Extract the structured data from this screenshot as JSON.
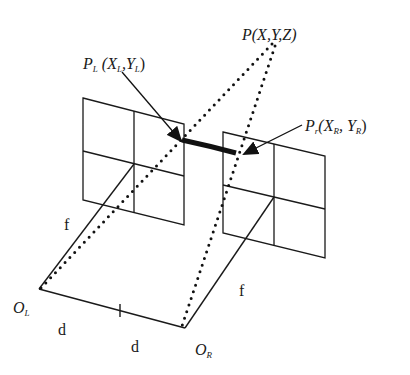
{
  "diagram": {
    "type": "stereo-vision-geometry",
    "stroke_color": "#1a1a1a",
    "background": "#ffffff",
    "labels": {
      "world_point": {
        "main": "P",
        "coords": "(X,Y,Z)"
      },
      "left_projection": {
        "main": "P",
        "sub": "L",
        "open": "(X",
        "sub_x": "L",
        "mid": ",Y",
        "sub_y": "L",
        "close": ")"
      },
      "right_projection": {
        "main": "P",
        "sub": "r",
        "open": "(X",
        "sub_x": "R",
        "mid": ", Y",
        "sub_y": "R",
        "close": ")"
      },
      "left_focal": "f",
      "right_focal": "f",
      "left_origin": {
        "main": "O",
        "sub": "L"
      },
      "right_origin": {
        "main": "O",
        "sub": "R"
      },
      "baseline_left_half": "d",
      "baseline_right_half": "d"
    },
    "points": {
      "P": [
        273,
        43
      ],
      "O_L": [
        39,
        289
      ],
      "O_R": [
        185,
        328
      ],
      "left_plane_center": [
        134,
        164
      ],
      "right_plane_center": [
        274,
        197
      ],
      "baseline_midpoint": [
        120,
        310
      ]
    },
    "planes": [
      {
        "name": "left-image-plane",
        "corners": [
          [
            83,
            98
          ],
          [
            184,
            124
          ],
          [
            184,
            225
          ],
          [
            83,
            200
          ]
        ]
      },
      {
        "name": "right-image-plane",
        "corners": [
          [
            223,
            132
          ],
          [
            325,
            156
          ],
          [
            325,
            258
          ],
          [
            223,
            233
          ]
        ]
      }
    ]
  }
}
